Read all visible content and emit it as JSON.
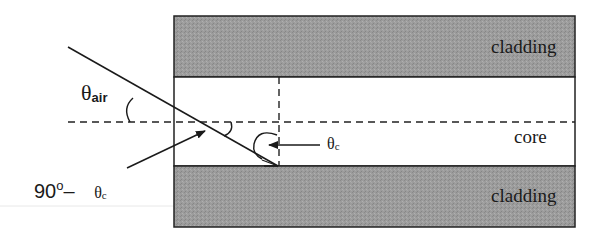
{
  "diagram": {
    "regions": {
      "top_cladding": "cladding",
      "core": "core",
      "bottom_cladding": "cladding"
    },
    "labels": {
      "theta_air_symbol": "θ",
      "theta_air_sub": "air",
      "theta_c_symbol": "θ",
      "theta_c_sub": "c",
      "ninety_value": "90",
      "ninety_degree": "o",
      "ninety_minus": "–",
      "ninety_theta": "θ",
      "ninety_theta_sub": "c"
    },
    "colors": {
      "cladding_fill": "#9a9a9a",
      "core_fill": "#ffffff",
      "line": "#1a1a1a",
      "separator": "#e6e6e6"
    }
  }
}
